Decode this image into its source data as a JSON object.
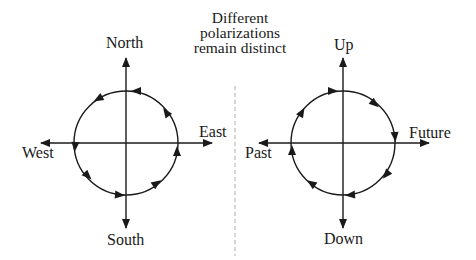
{
  "title": {
    "lines": [
      "Different",
      "polarizations",
      "remain distinct"
    ]
  },
  "diagrams": [
    {
      "name": "left-compass",
      "labels": {
        "top": "North",
        "bottom": "South",
        "left": "West",
        "right": "East"
      },
      "rotation": "counterclockwise",
      "arrow_count": 8
    },
    {
      "name": "right-compass",
      "labels": {
        "top": "Up",
        "bottom": "Down",
        "left": "Past",
        "right": "Future"
      },
      "rotation": "clockwise",
      "arrow_count": 8
    }
  ],
  "divider": {
    "style": "dashed",
    "color": "#bbbbbb"
  },
  "colors": {
    "stroke": "#1a1a1a",
    "background": "#ffffff"
  }
}
